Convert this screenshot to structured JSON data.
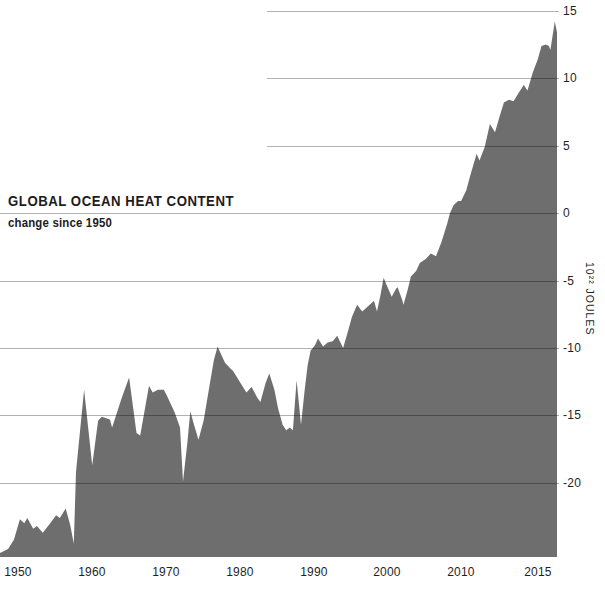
{
  "chart_data": {
    "type": "area",
    "title": "GLOBAL OCEAN HEAT CONTENT",
    "subtitle": "change since 1950",
    "xlabel": "",
    "ylabel": "10²² JOULES",
    "grid": "horizontal",
    "legend": "none",
    "fill_color": "#6E6E6E",
    "gridline_color": "rgba(0,0,0,0.30)",
    "background": "#FFFFFF",
    "xlim": [
      1947.5,
      2023
    ],
    "ylim": [
      -25.5,
      15.8
    ],
    "yticks": [
      {
        "label": "15",
        "value": 15
      },
      {
        "label": "10",
        "value": 10
      },
      {
        "label": "5",
        "value": 5
      },
      {
        "label": "0",
        "value": 0
      },
      {
        "label": "-5",
        "value": -5
      },
      {
        "label": "-10",
        "value": -10
      },
      {
        "label": "-15",
        "value": -15
      },
      {
        "label": "-20",
        "value": -20
      }
    ],
    "xticks": [
      {
        "label": "1950",
        "year": 1950
      },
      {
        "label": "1960",
        "year": 1960
      },
      {
        "label": "1970",
        "year": 1970
      },
      {
        "label": "1980",
        "year": 1980
      },
      {
        "label": "1990",
        "year": 1990
      },
      {
        "label": "2000",
        "year": 2000
      },
      {
        "label": "2010",
        "year": 2010
      },
      {
        "label": "2015",
        "year": 2020.4
      }
    ],
    "series": [
      {
        "name": "Global ocean heat content change since 1950 (10²² joules)",
        "points": [
          [
            1947.5,
            -25.2
          ],
          [
            1948.6,
            -24.9
          ],
          [
            1949.4,
            -24.2
          ],
          [
            1950.2,
            -22.7
          ],
          [
            1950.8,
            -23.0
          ],
          [
            1951.2,
            -22.6
          ],
          [
            1952.0,
            -23.4
          ],
          [
            1952.5,
            -23.2
          ],
          [
            1953.3,
            -23.7
          ],
          [
            1954.3,
            -23.0
          ],
          [
            1955.1,
            -22.4
          ],
          [
            1955.6,
            -22.6
          ],
          [
            1956.4,
            -21.9
          ],
          [
            1957.0,
            -23.1
          ],
          [
            1957.5,
            -24.5
          ],
          [
            1957.8,
            -19.2
          ],
          [
            1958.9,
            -13.1
          ],
          [
            1960.0,
            -18.7
          ],
          [
            1960.8,
            -15.4
          ],
          [
            1961.3,
            -15.1
          ],
          [
            1962.4,
            -15.3
          ],
          [
            1962.7,
            -15.9
          ],
          [
            1964.0,
            -13.7
          ],
          [
            1965.0,
            -12.2
          ],
          [
            1966.0,
            -16.3
          ],
          [
            1966.5,
            -16.5
          ],
          [
            1967.7,
            -12.8
          ],
          [
            1968.2,
            -13.3
          ],
          [
            1968.9,
            -13.1
          ],
          [
            1969.7,
            -13.1
          ],
          [
            1970.1,
            -13.5
          ],
          [
            1971.2,
            -14.8
          ],
          [
            1971.9,
            -15.9
          ],
          [
            1972.3,
            -19.9
          ],
          [
            1972.9,
            -17.0
          ],
          [
            1973.3,
            -14.7
          ],
          [
            1973.8,
            -15.7
          ],
          [
            1974.4,
            -16.8
          ],
          [
            1975.1,
            -15.4
          ],
          [
            1975.9,
            -12.8
          ],
          [
            1976.5,
            -10.9
          ],
          [
            1977.0,
            -9.9
          ],
          [
            1977.5,
            -10.5
          ],
          [
            1978.0,
            -11.1
          ],
          [
            1978.7,
            -11.5
          ],
          [
            1979.1,
            -11.7
          ],
          [
            1980.1,
            -12.6
          ],
          [
            1980.9,
            -13.3
          ],
          [
            1981.6,
            -12.9
          ],
          [
            1982.4,
            -13.7
          ],
          [
            1982.8,
            -14.0
          ],
          [
            1983.5,
            -12.6
          ],
          [
            1984.0,
            -11.9
          ],
          [
            1984.7,
            -13.1
          ],
          [
            1985.2,
            -14.5
          ],
          [
            1985.8,
            -15.7
          ],
          [
            1986.3,
            -16.1
          ],
          [
            1986.8,
            -15.9
          ],
          [
            1987.2,
            -16.1
          ],
          [
            1987.7,
            -12.4
          ],
          [
            1988.3,
            -15.7
          ],
          [
            1988.8,
            -13.1
          ],
          [
            1989.2,
            -11.3
          ],
          [
            1989.6,
            -10.2
          ],
          [
            1990.2,
            -9.8
          ],
          [
            1990.6,
            -9.3
          ],
          [
            1991.3,
            -9.9
          ],
          [
            1991.9,
            -9.6
          ],
          [
            1992.6,
            -9.5
          ],
          [
            1993.2,
            -9.1
          ],
          [
            1994.0,
            -10.0
          ],
          [
            1994.7,
            -8.7
          ],
          [
            1995.2,
            -7.7
          ],
          [
            1995.9,
            -6.8
          ],
          [
            1996.6,
            -7.3
          ],
          [
            1997.2,
            -7.0
          ],
          [
            1998.2,
            -6.5
          ],
          [
            1998.6,
            -7.3
          ],
          [
            1999.1,
            -6.0
          ],
          [
            1999.5,
            -4.8
          ],
          [
            2000.1,
            -5.6
          ],
          [
            2000.6,
            -6.2
          ],
          [
            2001.2,
            -5.6
          ],
          [
            2001.4,
            -5.5
          ],
          [
            2002.0,
            -6.4
          ],
          [
            2002.2,
            -6.8
          ],
          [
            2002.8,
            -5.6
          ],
          [
            2003.2,
            -4.7
          ],
          [
            2003.9,
            -4.3
          ],
          [
            2004.4,
            -3.7
          ],
          [
            2005.2,
            -3.4
          ],
          [
            2005.9,
            -3.0
          ],
          [
            2006.6,
            -3.2
          ],
          [
            2007.3,
            -2.2
          ],
          [
            2008.1,
            -0.8
          ],
          [
            2008.5,
            0.0
          ],
          [
            2009.0,
            0.6
          ],
          [
            2009.6,
            0.9
          ],
          [
            2010.0,
            0.9
          ],
          [
            2010.7,
            1.7
          ],
          [
            2011.2,
            2.7
          ],
          [
            2011.9,
            4.0
          ],
          [
            2012.1,
            4.4
          ],
          [
            2012.5,
            3.9
          ],
          [
            2013.2,
            4.9
          ],
          [
            2013.9,
            6.6
          ],
          [
            2014.6,
            6.0
          ],
          [
            2015.3,
            7.3
          ],
          [
            2015.8,
            8.2
          ],
          [
            2016.5,
            8.4
          ],
          [
            2017.1,
            8.3
          ],
          [
            2017.8,
            8.9
          ],
          [
            2018.5,
            9.5
          ],
          [
            2019.0,
            9.1
          ],
          [
            2019.7,
            10.4
          ],
          [
            2020.4,
            11.4
          ],
          [
            2020.9,
            12.4
          ],
          [
            2021.5,
            12.5
          ],
          [
            2021.9,
            12.4
          ],
          [
            2022.1,
            12.1
          ],
          [
            2022.7,
            14.2
          ],
          [
            2023.0,
            13.4
          ]
        ]
      }
    ]
  }
}
